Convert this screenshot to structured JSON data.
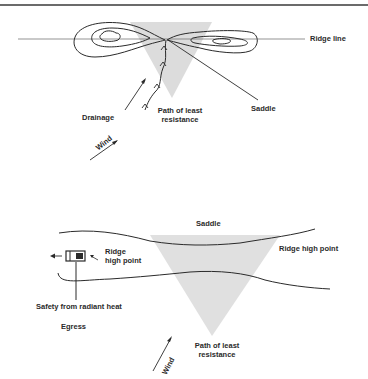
{
  "top_diagram": {
    "labels": {
      "ridge_line": "Ridge line",
      "drainage": "Drainage",
      "path_line1": "Path of least",
      "path_line2": "resistance",
      "saddle": "Saddle",
      "wind": "Wind"
    }
  },
  "bottom_diagram": {
    "labels": {
      "saddle": "Saddle",
      "ridge_high_point_right": "Ridge high point",
      "ridge_line1": "Ridge",
      "ridge_line2": "high point",
      "safety": "Safety from radiant heat",
      "egress": "Egress",
      "path_line1": "Path of least",
      "path_line2": "resistance",
      "wind": "Wind"
    }
  },
  "colors": {
    "ink": "#2a2a2a",
    "shade": "#d9d9d9",
    "rule": "#3a3a3a"
  }
}
